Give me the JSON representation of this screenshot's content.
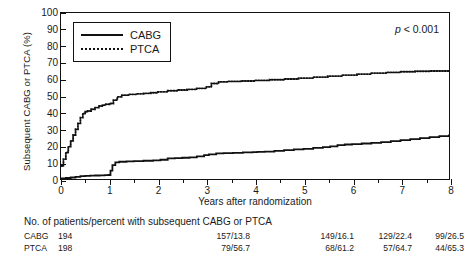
{
  "figure": {
    "ylabel": "Subsequent CABG or PTCA (%)",
    "xlabel": "Years after randomization",
    "pvalue_prefix": "p",
    "pvalue_rest": " < 0.001"
  },
  "legend": {
    "items": [
      {
        "label": "CABG",
        "style": "solid"
      },
      {
        "label": "PTCA",
        "style": "dotted"
      }
    ]
  },
  "axes": {
    "y_ticks": [
      "0",
      "10",
      "20",
      "30",
      "40",
      "50",
      "60",
      "70",
      "80",
      "90",
      "100"
    ],
    "x_ticks": [
      "0",
      "1",
      "2",
      "3",
      "4",
      "5",
      "6",
      "7",
      "8"
    ]
  },
  "risk_table": {
    "header": "No. of patients/percent with subsequent CABG or PTCA",
    "rows": [
      {
        "group": "CABG",
        "v0": "194",
        "v1": "157/13.8",
        "v2": "149/16.1",
        "v3": "129/22.4",
        "v4": "99/26.5"
      },
      {
        "group": "PTCA",
        "v0": "198",
        "v1": "79/56.7",
        "v2": "68/61.2",
        "v3": "57/64.7",
        "v4": "44/65.3"
      }
    ]
  },
  "chart_data": {
    "type": "line",
    "title": "",
    "xlabel": "Years after randomization",
    "ylabel": "Subsequent CABG or PTCA (%)",
    "xlim": [
      0,
      8
    ],
    "ylim": [
      0,
      100
    ],
    "grid": false,
    "legend_position": "top-left",
    "annotation": "p < 0.001",
    "series": [
      {
        "name": "CABG",
        "style": "solid",
        "color": "#111111",
        "points": [
          [
            0.0,
            0.4
          ],
          [
            0.1,
            0.6
          ],
          [
            0.2,
            0.9
          ],
          [
            0.3,
            1.3
          ],
          [
            0.4,
            1.7
          ],
          [
            0.5,
            1.9
          ],
          [
            0.6,
            2.0
          ],
          [
            0.7,
            2.1
          ],
          [
            0.8,
            2.2
          ],
          [
            0.9,
            2.3
          ],
          [
            0.98,
            2.4
          ],
          [
            1.02,
            5.0
          ],
          [
            1.06,
            8.4
          ],
          [
            1.12,
            10.0
          ],
          [
            1.2,
            10.4
          ],
          [
            1.35,
            10.6
          ],
          [
            1.5,
            10.8
          ],
          [
            1.7,
            11.0
          ],
          [
            1.9,
            11.2
          ],
          [
            2.05,
            11.6
          ],
          [
            2.2,
            12.4
          ],
          [
            2.35,
            12.6
          ],
          [
            2.5,
            12.8
          ],
          [
            2.65,
            13.0
          ],
          [
            2.8,
            13.6
          ],
          [
            2.95,
            14.4
          ],
          [
            3.05,
            14.8
          ],
          [
            3.2,
            15.4
          ],
          [
            3.35,
            15.6
          ],
          [
            3.55,
            15.8
          ],
          [
            3.75,
            16.0
          ],
          [
            3.95,
            16.2
          ],
          [
            4.05,
            16.3
          ],
          [
            4.2,
            16.5
          ],
          [
            4.4,
            17.0
          ],
          [
            4.6,
            17.4
          ],
          [
            4.8,
            17.8
          ],
          [
            5.0,
            18.2
          ],
          [
            5.2,
            18.8
          ],
          [
            5.4,
            19.2
          ],
          [
            5.55,
            19.6
          ],
          [
            5.7,
            20.4
          ],
          [
            5.85,
            20.8
          ],
          [
            6.0,
            21.0
          ],
          [
            6.2,
            21.4
          ],
          [
            6.4,
            21.8
          ],
          [
            6.6,
            22.2
          ],
          [
            6.8,
            22.8
          ],
          [
            7.0,
            23.4
          ],
          [
            7.2,
            24.0
          ],
          [
            7.4,
            24.6
          ],
          [
            7.6,
            25.2
          ],
          [
            7.8,
            25.8
          ],
          [
            8.0,
            26.8
          ]
        ]
      },
      {
        "name": "PTCA",
        "style": "dotted",
        "color": "#111111",
        "points": [
          [
            0.0,
            7.8
          ],
          [
            0.05,
            12.0
          ],
          [
            0.1,
            16.0
          ],
          [
            0.15,
            19.5
          ],
          [
            0.2,
            23.0
          ],
          [
            0.25,
            26.5
          ],
          [
            0.3,
            30.0
          ],
          [
            0.35,
            33.5
          ],
          [
            0.4,
            37.0
          ],
          [
            0.45,
            39.5
          ],
          [
            0.5,
            40.5
          ],
          [
            0.55,
            41.0
          ],
          [
            0.62,
            42.0
          ],
          [
            0.7,
            43.0
          ],
          [
            0.78,
            44.0
          ],
          [
            0.85,
            44.5
          ],
          [
            0.92,
            45.0
          ],
          [
            1.0,
            45.5
          ],
          [
            1.08,
            47.5
          ],
          [
            1.16,
            49.5
          ],
          [
            1.25,
            50.5
          ],
          [
            1.4,
            51.0
          ],
          [
            1.55,
            51.3
          ],
          [
            1.7,
            51.6
          ],
          [
            1.85,
            52.0
          ],
          [
            2.0,
            52.5
          ],
          [
            2.2,
            53.2
          ],
          [
            2.4,
            53.6
          ],
          [
            2.6,
            54.0
          ],
          [
            2.8,
            54.6
          ],
          [
            3.0,
            55.5
          ],
          [
            3.1,
            57.5
          ],
          [
            3.25,
            58.5
          ],
          [
            3.45,
            58.8
          ],
          [
            3.7,
            59.0
          ],
          [
            4.0,
            59.4
          ],
          [
            4.3,
            59.8
          ],
          [
            4.6,
            60.2
          ],
          [
            4.9,
            60.8
          ],
          [
            5.2,
            61.4
          ],
          [
            5.5,
            62.0
          ],
          [
            5.8,
            62.6
          ],
          [
            6.1,
            63.2
          ],
          [
            6.4,
            63.8
          ],
          [
            6.7,
            64.2
          ],
          [
            7.0,
            64.6
          ],
          [
            7.3,
            64.9
          ],
          [
            7.6,
            65.1
          ],
          [
            8.0,
            65.3
          ]
        ]
      }
    ]
  }
}
